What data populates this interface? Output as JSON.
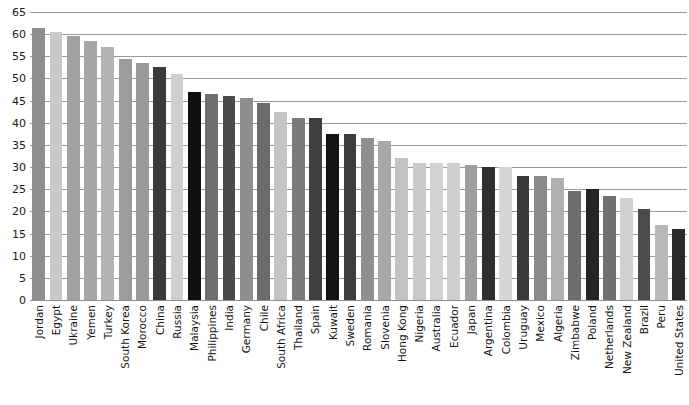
{
  "chart_data": {
    "type": "bar",
    "title": "",
    "xlabel": "",
    "ylabel": "",
    "ylim": [
      0,
      65
    ],
    "yticks": [
      0,
      5,
      10,
      15,
      20,
      25,
      30,
      35,
      40,
      45,
      50,
      55,
      60,
      65
    ],
    "grid": true,
    "legend": "none",
    "categories": [
      "Jordan",
      "Egypt",
      "Ukraine",
      "Yemen",
      "Turkey",
      "South Korea",
      "Morocco",
      "China",
      "Russia",
      "Malaysia",
      "Philippines",
      "India",
      "Germany",
      "Chile",
      "South Africa",
      "Thailand",
      "Spain",
      "Kuwait",
      "Sweden",
      "Romania",
      "Slovenia",
      "Hong Kong",
      "Nigeria",
      "Australia",
      "Ecuador",
      "Japan",
      "Argentina",
      "Colombia",
      "Uruguay",
      "Mexico",
      "Algeria",
      "Zimbabwe",
      "Poland",
      "Netherlands",
      "New Zealand",
      "Brazil",
      "Peru",
      "United States"
    ],
    "values": [
      61.5,
      60.5,
      59.5,
      58.5,
      57.0,
      54.5,
      53.5,
      52.5,
      51.0,
      47.0,
      46.5,
      46.0,
      45.5,
      44.5,
      42.5,
      41.0,
      41.0,
      37.5,
      37.5,
      36.5,
      36.0,
      32.0,
      31.0,
      31.0,
      31.0,
      30.5,
      30.0,
      30.0,
      28.0,
      28.0,
      27.5,
      24.5,
      25.0,
      23.5,
      23.0,
      20.5,
      17.0,
      16.0
    ],
    "bar_colors": [
      "#8e8e8e",
      "#c9c9c9",
      "#a0a0a0",
      "#a6a6a6",
      "#b3b3b3",
      "#9c9c9c",
      "#9a9a9a",
      "#3a3a3a",
      "#cfcfcf",
      "#111111",
      "#6f6f6f",
      "#4a4a4a",
      "#8d8d8d",
      "#6b6b6b",
      "#c4c4c4",
      "#7a7a7a",
      "#3f3f3f",
      "#121212",
      "#3d3d3d",
      "#8f8f8f",
      "#a8a8a8",
      "#c2c2c2",
      "#cacaca",
      "#d2d2d2",
      "#cfcfcf",
      "#9e9e9e",
      "#2f2f2f",
      "#d6d6d6",
      "#3a3a3a",
      "#8a8a8a",
      "#b0b0b0",
      "#6e6e6e",
      "#242424",
      "#707070",
      "#d0d0d0",
      "#4b4b4b",
      "#b8b8b8",
      "#2b2b2b"
    ]
  }
}
